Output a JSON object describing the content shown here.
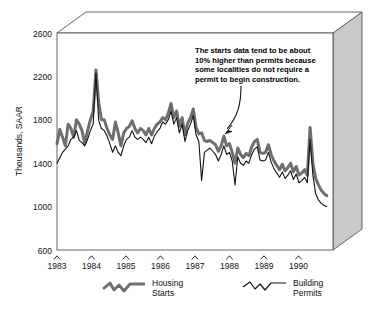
{
  "chart_data": {
    "type": "line",
    "title": "",
    "xlabel": "",
    "ylabel": "Thousands, SAAR",
    "ylim": [
      600,
      2600
    ],
    "yticks": [
      600,
      1000,
      1400,
      1800,
      2200,
      2600
    ],
    "ytick_labels": [
      "600",
      "1000",
      "1400",
      "1800",
      "2200",
      "2600"
    ],
    "xlim": [
      1983.0,
      1991.0
    ],
    "xticks": [
      1983,
      1984,
      1985,
      1986,
      1987,
      1988,
      1989,
      1990
    ],
    "xtick_labels": [
      "1983",
      "1984",
      "1985",
      "1986",
      "1987",
      "1988",
      "1989",
      "1990"
    ],
    "grid": false,
    "legend_position": "below-axis",
    "series": [
      {
        "name": "Housing Starts",
        "color": "#6e6e6e",
        "linewidth": 3,
        "values": [
          1580,
          1710,
          1640,
          1560,
          1760,
          1720,
          1640,
          1800,
          1760,
          1700,
          1580,
          1700,
          1800,
          1880,
          2260,
          1960,
          1800,
          1800,
          1720,
          1660,
          1620,
          1780,
          1680,
          1560,
          1680,
          1720,
          1740,
          1790,
          1720,
          1680,
          1720,
          1700,
          1660,
          1720,
          1660,
          1720,
          1760,
          1780,
          1820,
          1800,
          1860,
          1950,
          1820,
          1880,
          1740,
          1820,
          1660,
          1770,
          1820,
          1900,
          1730,
          1670,
          1680,
          1610,
          1600,
          1610,
          1590,
          1570,
          1510,
          1560,
          1650,
          1560,
          1580,
          1500,
          1400,
          1540,
          1480,
          1450,
          1490,
          1470,
          1550,
          1600,
          1620,
          1500,
          1490,
          1500,
          1570,
          1480,
          1420,
          1380,
          1340,
          1390,
          1330,
          1360,
          1400,
          1320,
          1370,
          1290,
          1310,
          1340,
          1290,
          1730,
          1400,
          1260,
          1200,
          1150,
          1120,
          1100
        ]
      },
      {
        "name": "Building Permits",
        "color": "#111111",
        "linewidth": 1.1,
        "values": [
          1400,
          1450,
          1500,
          1530,
          1560,
          1620,
          1640,
          1700,
          1610,
          1590,
          1560,
          1620,
          1700,
          1760,
          2230,
          1790,
          1720,
          1700,
          1650,
          1580,
          1500,
          1560,
          1500,
          1470,
          1560,
          1620,
          1640,
          1700,
          1640,
          1620,
          1640,
          1620,
          1590,
          1640,
          1580,
          1650,
          1690,
          1720,
          1780,
          1760,
          1800,
          1880,
          1760,
          1820,
          1680,
          1760,
          1600,
          1700,
          1760,
          1840,
          1660,
          1600,
          1240,
          1500,
          1520,
          1540,
          1510,
          1480,
          1420,
          1480,
          1560,
          1480,
          1500,
          1420,
          1200,
          1460,
          1400,
          1380,
          1420,
          1400,
          1480,
          1530,
          1550,
          1430,
          1420,
          1430,
          1500,
          1410,
          1350,
          1310,
          1270,
          1320,
          1260,
          1290,
          1330,
          1250,
          1300,
          1220,
          1240,
          1270,
          1220,
          1620,
          1290,
          1120,
          1060,
          1030,
          1010,
          1000
        ]
      }
    ],
    "annotations": [
      {
        "id": "starts-vs-permits-note",
        "lines": [
          "The starts data tend to be about",
          "10% higher than permits because",
          "some localities do not require a",
          "permit to begin construction."
        ],
        "arrow": true
      }
    ]
  },
  "legend": {
    "items": [
      {
        "label_line1": "Housing",
        "label_line2": "Starts",
        "swatch": "thick-gray-squiggle"
      },
      {
        "label_line1": "Building",
        "label_line2": "Permits",
        "swatch": "thin-black-squiggle"
      }
    ]
  },
  "colors": {
    "background": "#ffffff",
    "frame": "#555555",
    "side_panel": "#c9c9c9",
    "top_panel": "#ffffff",
    "starts": "#6e6e6e",
    "permits": "#111111",
    "text": "#111111"
  }
}
